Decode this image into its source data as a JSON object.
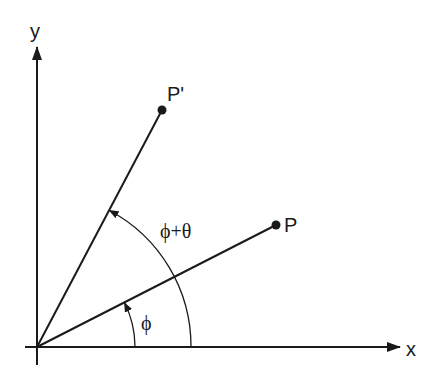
{
  "diagram": {
    "type": "rotation-of-point",
    "axes": {
      "x_label": "x",
      "y_label": "y"
    },
    "points": {
      "P": {
        "label": "P"
      },
      "P_prime": {
        "label": "P'"
      }
    },
    "angles": {
      "phi": {
        "label": "ϕ"
      },
      "phi_plus_theta": {
        "label": "ϕ+θ"
      }
    },
    "colors": {
      "stroke": "#1a1a1a",
      "background": "#ffffff"
    }
  }
}
